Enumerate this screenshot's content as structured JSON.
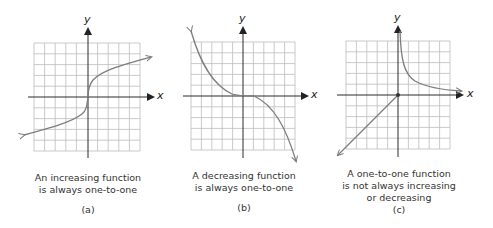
{
  "colors": {
    "grid": "#bdbdbd",
    "axis": "#2a2a2a",
    "curve": "#7d7d7d",
    "text": "#333333"
  },
  "panels": [
    {
      "id": "a",
      "x_axis_label": "x",
      "y_axis_label": "y",
      "caption_lines": [
        "An increasing function",
        "is always one-to-one"
      ],
      "tag": "(a)"
    },
    {
      "id": "b",
      "x_axis_label": "x",
      "y_axis_label": "y",
      "caption_lines": [
        "A decreasing function",
        "is always one-to-one"
      ],
      "tag": "(b)"
    },
    {
      "id": "c",
      "x_axis_label": "x",
      "y_axis_label": "y",
      "caption_lines": [
        "A one-to-one function",
        "is not always increasing",
        "or decreasing"
      ],
      "tag": "(c)"
    }
  ]
}
